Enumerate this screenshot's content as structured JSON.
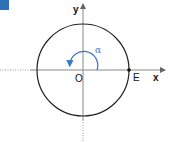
{
  "figure": {
    "badge_color": "#2f6fb6",
    "labels": {
      "y_axis": "y",
      "x_axis": "x",
      "origin": "O",
      "point": "E",
      "angle": "α"
    },
    "colors": {
      "circle": "#222222",
      "axes": "#888888",
      "angle_arc": "#3a78c2"
    }
  }
}
